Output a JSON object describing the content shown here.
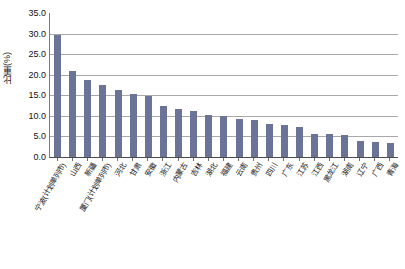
{
  "chart_data": {
    "type": "bar",
    "title": "",
    "subtitle": "",
    "xlabel": "",
    "ylabel": "比重(%)",
    "ylim": [
      0,
      35
    ],
    "ytick_step": 5,
    "ytick_labels": [
      "35.0",
      "30.0",
      "25.0",
      "20.0",
      "15.0",
      "10.0",
      "5.0",
      "0.0"
    ],
    "ytick_values": [
      35,
      30,
      25,
      20,
      15,
      10,
      5,
      0
    ],
    "grid": true,
    "legend": false,
    "legend_position": "none",
    "bar_color": "#6b7396",
    "gridline_color": "#a8a8a8",
    "axis_color": "#4c4c4c",
    "categories": [
      "宁波(计划单列市)",
      "山西",
      "新疆",
      "厦门(计划单列市)",
      "河北",
      "甘肃",
      "安徽",
      "浙江",
      "内蒙古",
      "吉林",
      "湖北",
      "福建",
      "云南",
      "贵州",
      "四川",
      "广东",
      "江苏",
      "江西",
      "黑龙江",
      "湖南",
      "辽宁",
      "广西",
      "青海"
    ],
    "values": [
      29.7,
      20.8,
      18.8,
      17.6,
      16.4,
      15.2,
      14.8,
      12.3,
      11.6,
      11.2,
      10.1,
      10.0,
      9.3,
      9.1,
      8.0,
      7.7,
      7.4,
      5.6,
      5.5,
      5.3,
      3.8,
      3.7,
      3.5
    ]
  }
}
